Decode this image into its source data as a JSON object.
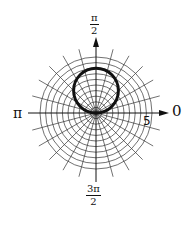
{
  "chart_data": {
    "type": "polar",
    "title": "",
    "curve": {
      "equation": "r = 4 sin θ",
      "shape": "circle",
      "diameter": 4,
      "center_polar": [
        2,
        "π/2"
      ],
      "stroke": "#111111"
    },
    "grid": {
      "rings": 10,
      "ring_step": 0.5,
      "rmax": 5,
      "spokes": 24,
      "spoke_step_deg": 15,
      "color": "#333333"
    },
    "axis_labels": {
      "right": "0",
      "top_num": "π",
      "top_den": "2",
      "left": "π",
      "bottom_num": "3π",
      "bottom_den": "2"
    },
    "tick_labels": [
      {
        "value": "5",
        "position": "r=5 on θ=0 axis"
      }
    ]
  }
}
